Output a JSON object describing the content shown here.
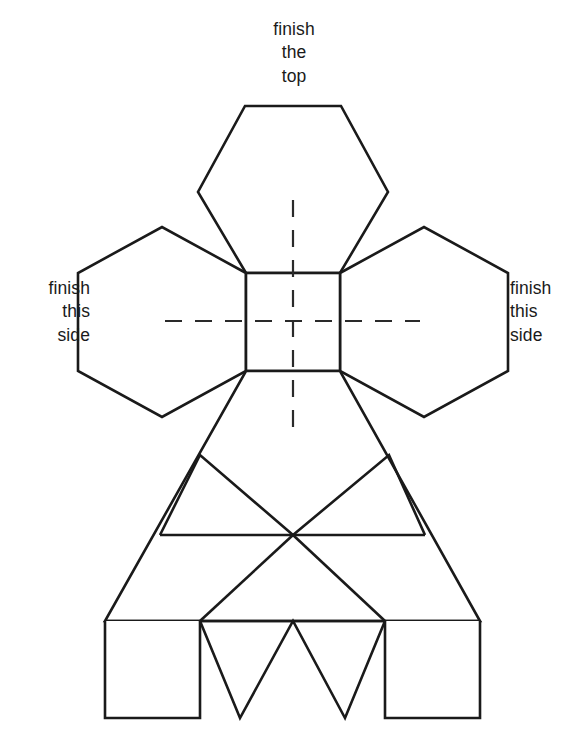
{
  "document": {
    "type": "papercraft-net",
    "title": "Hexagonal solid unfolded net with assembly labels"
  },
  "labels": {
    "top": "finish\nthe\ntop",
    "left": "finish\nthis\nside",
    "right": "finish\nthis\nside"
  },
  "style": {
    "stroke_color": "#1a1a1a",
    "fill_color": "#ffffff",
    "background": "#ffffff",
    "stroke_width": 2.6,
    "dash_color": "#2a2a2a",
    "dash_width": 2.2,
    "dash_pattern": "17 13"
  },
  "geometry": {
    "center_square": {
      "x1": 246,
      "y1": 273,
      "x2": 340,
      "y2": 371
    },
    "hexagon_top": [
      [
        246,
        273
      ],
      [
        198,
        192
      ],
      [
        245,
        106
      ],
      [
        341,
        106
      ],
      [
        388,
        192
      ],
      [
        340,
        273
      ]
    ],
    "hexagon_left": [
      [
        246,
        273
      ],
      [
        162,
        227
      ],
      [
        78,
        273
      ],
      [
        78,
        371
      ],
      [
        162,
        417
      ],
      [
        246,
        371
      ]
    ],
    "hexagon_right": [
      [
        340,
        273
      ],
      [
        424,
        227
      ],
      [
        508,
        273
      ],
      [
        508,
        371
      ],
      [
        424,
        417
      ],
      [
        340,
        371
      ]
    ],
    "body_trapezoid": [
      [
        246,
        371
      ],
      [
        340,
        371
      ],
      [
        480,
        621
      ],
      [
        105,
        621
      ]
    ],
    "band_line_y": 535,
    "band_line_x1": 160,
    "band_line_x2": 425,
    "triangle_apex_left": [
      200,
      455
    ],
    "triangle_apex_right": [
      389,
      455
    ],
    "triangle_base_left": [
      293,
      535
    ],
    "triangle_base_right": [
      293,
      535
    ],
    "bottom_line_y": 621,
    "tab_left": {
      "x1": 105,
      "y1": 621,
      "x2": 200,
      "y2": 718
    },
    "tab_right": {
      "x1": 385,
      "y1": 621,
      "x2": 480,
      "y2": 718
    },
    "zigzag_points": [
      [
        200,
        621
      ],
      [
        240,
        718
      ],
      [
        293,
        621
      ],
      [
        345,
        718
      ],
      [
        385,
        621
      ]
    ],
    "dash_vertical": {
      "x": 293,
      "y1": 200,
      "y2": 440
    },
    "dash_horizontal": {
      "y": 321,
      "x1": 165,
      "x2": 420
    }
  },
  "page": {
    "number": ""
  }
}
